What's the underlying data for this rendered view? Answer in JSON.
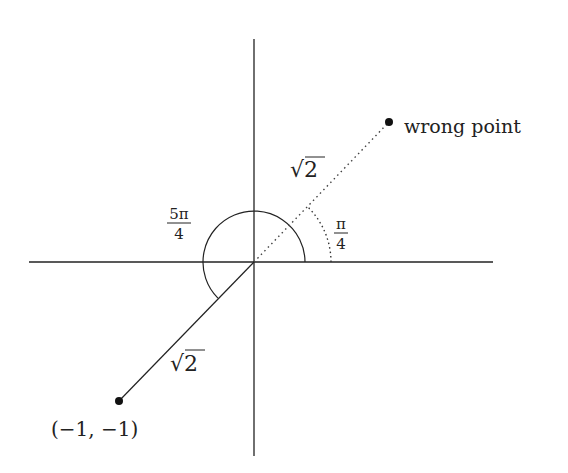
{
  "diagram": {
    "colors": {
      "stroke": "#222222",
      "dotted": "#555555",
      "background": "#ffffff"
    },
    "axes": {
      "origin": [
        254,
        262
      ],
      "x_axis": {
        "from": [
          29,
          262
        ],
        "to": [
          493,
          262
        ]
      },
      "y_axis": {
        "from": [
          254,
          39
        ],
        "to": [
          254,
          456
        ]
      }
    },
    "points": [
      {
        "id": "correct-point",
        "label": "(−1, −1)",
        "pos": [
          119,
          401
        ]
      },
      {
        "id": "wrong-point",
        "label": "wrong point",
        "pos": [
          389,
          122
        ]
      }
    ],
    "segments": [
      {
        "id": "solid-radius",
        "style": "solid",
        "length_label": "√2"
      },
      {
        "id": "dotted-radius",
        "style": "dotted",
        "length_label": "√2"
      }
    ],
    "angles": [
      {
        "id": "angle-5pi-4",
        "style": "solid",
        "numerator": "5π",
        "denominator": "4",
        "radius": 51
      },
      {
        "id": "angle-pi-4",
        "style": "dotted",
        "numerator": "π",
        "denominator": "4",
        "radius": 77
      }
    ]
  }
}
